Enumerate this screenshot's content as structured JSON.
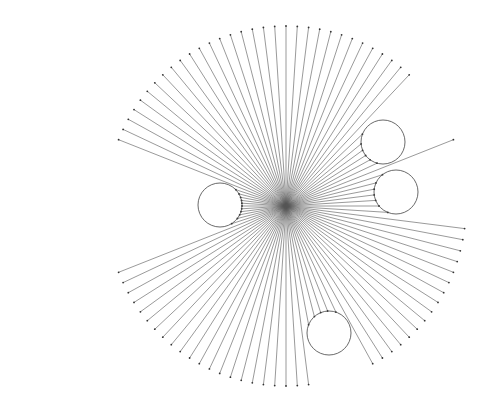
{
  "diagram": {
    "type": "radial-ray-visibility",
    "center": {
      "x": 286,
      "y": 206
    },
    "ray_count": 100,
    "ray_length": 180,
    "ray_color": "#555555",
    "endpoint_color": "#333333",
    "obstacles": [
      {
        "name": "left-circle",
        "cx": 220,
        "cy": 205,
        "r": 22
      },
      {
        "name": "upper-right-circle",
        "cx": 383,
        "cy": 142,
        "r": 22
      },
      {
        "name": "right-circle",
        "cx": 396,
        "cy": 192,
        "r": 22
      },
      {
        "name": "bottom-circle",
        "cx": 329,
        "cy": 333,
        "r": 22
      }
    ],
    "obstacle_stroke": "#444444"
  }
}
